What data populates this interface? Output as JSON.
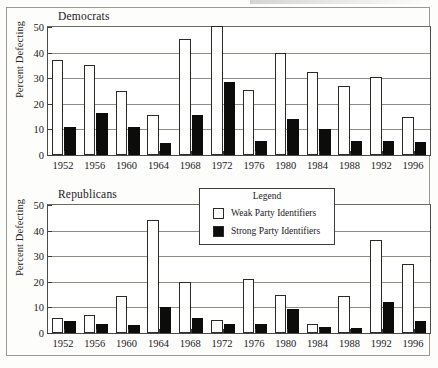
{
  "figure": {
    "ylabel": "Percent Defecting",
    "legend": {
      "title": "Legend",
      "weak_label": "Weak Party Identifiers",
      "strong_label": "Strong Party Identifiers"
    },
    "panels": [
      {
        "title": "Democrats"
      },
      {
        "title": "Republicans"
      }
    ]
  },
  "chart_data": [
    {
      "type": "bar",
      "title": "Democrats",
      "xlabel": "",
      "ylabel": "Percent Defecting",
      "ylim": [
        0,
        50
      ],
      "yticks": [
        0,
        10,
        20,
        30,
        40,
        50
      ],
      "grid": true,
      "legend_position": "shared-center",
      "categories": [
        "1952",
        "1956",
        "1960",
        "1964",
        "1968",
        "1972",
        "1976",
        "1980",
        "1984",
        "1988",
        "1992",
        "1996"
      ],
      "series": [
        {
          "name": "Weak Party Identifiers",
          "color": "#ffffff",
          "values": [
            37,
            35,
            25,
            15.5,
            45.5,
            50.5,
            25.5,
            40,
            32.5,
            27,
            30.5,
            15
          ]
        },
        {
          "name": "Strong Party Identifiers",
          "color": "#0c0c0a",
          "values": [
            11,
            16.5,
            11,
            4.5,
            15.5,
            28.5,
            5.5,
            14,
            10,
            5.5,
            5.5,
            5
          ]
        }
      ]
    },
    {
      "type": "bar",
      "title": "Republicans",
      "xlabel": "",
      "ylabel": "Percent Defecting",
      "ylim": [
        0,
        50
      ],
      "yticks": [
        0,
        10,
        20,
        30,
        40,
        50
      ],
      "grid": true,
      "legend_position": "upper-center",
      "categories": [
        "1952",
        "1956",
        "1960",
        "1964",
        "1968",
        "1972",
        "1976",
        "1980",
        "1984",
        "1988",
        "1992",
        "1996"
      ],
      "series": [
        {
          "name": "Weak Party Identifiers",
          "color": "#ffffff",
          "values": [
            6,
            7,
            14.5,
            44,
            20,
            5,
            21,
            15,
            3.5,
            14.5,
            36.5,
            27
          ]
        },
        {
          "name": "Strong Party Identifiers",
          "color": "#0c0c0a",
          "values": [
            4.5,
            3.5,
            3,
            10,
            6,
            3.5,
            3.5,
            9.5,
            2.5,
            2,
            12,
            4.5
          ]
        }
      ]
    }
  ]
}
